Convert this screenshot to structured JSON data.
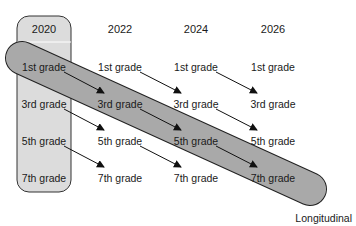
{
  "diagram": {
    "type": "cohort-design",
    "years": [
      "2020",
      "2022",
      "2024",
      "2026"
    ],
    "grades": [
      "1st grade",
      "3rd grade",
      "5th grade",
      "7th grade"
    ],
    "cross_sectional_column": "2020",
    "longitudinal_label": "Longitudinal",
    "colors": {
      "cross_sectional_fill": "#dcdcdc",
      "longitudinal_fill": "#a9a9a9",
      "stroke": "#222222",
      "text": "#1a1a1a"
    },
    "arrows": [
      {
        "from": "2020-1st grade",
        "to": "2022-3rd grade"
      },
      {
        "from": "2020-3rd grade",
        "to": "2022-5th grade"
      },
      {
        "from": "2020-5th grade",
        "to": "2022-7th grade"
      },
      {
        "from": "2022-1st grade",
        "to": "2024-3rd grade"
      },
      {
        "from": "2022-3rd grade",
        "to": "2024-5th grade"
      },
      {
        "from": "2022-5th grade",
        "to": "2024-7th grade"
      },
      {
        "from": "2024-1st grade",
        "to": "2026-3rd grade"
      },
      {
        "from": "2024-3rd grade",
        "to": "2026-5th grade"
      },
      {
        "from": "2024-5th grade",
        "to": "2026-7th grade"
      }
    ]
  },
  "cells": {
    "c2020": [
      "1st grade",
      "3rd grade",
      "5th grade",
      "7th grade"
    ],
    "c2022": [
      "1st grade",
      "3rd grade",
      "5th grade",
      "7th grade"
    ],
    "c2024": [
      "1st grade",
      "3rd grade",
      "5th grade",
      "7th grade"
    ],
    "c2026": [
      "1st grade",
      "3rd grade",
      "5th grade",
      "7th grade"
    ]
  }
}
